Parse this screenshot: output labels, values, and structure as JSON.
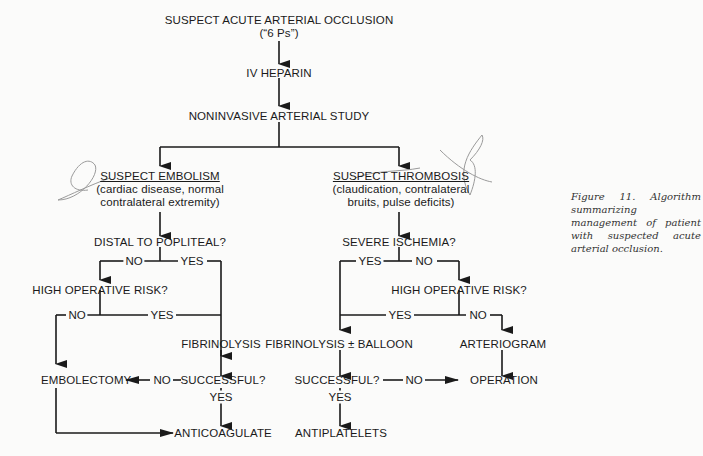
{
  "diagram": {
    "root": {
      "line1": "SUSPECT ACUTE ARTERIAL OCCLUSION",
      "line2": "(“6 Ps”)"
    },
    "step_heparin": "IV HEPARIN",
    "step_study": "NONINVASIVE ARTERIAL STUDY",
    "left_branch": {
      "heading": "SUSPECT EMBOLISM",
      "detail_line1": "(cardiac disease, normal",
      "detail_line2": "contralateral extremity)",
      "q_distal": "DISTAL TO POPLITEAL?",
      "q_distal_no": "NO",
      "q_distal_yes": "YES",
      "q_risk": "HIGH OPERATIVE RISK?",
      "q_risk_no": "NO",
      "q_risk_yes": "YES",
      "fibrinolysis": "FIBRINOLYSIS",
      "embolectomy": "EMBOLECTOMY",
      "q_success": "SUCCESSFUL?",
      "q_success_no": "NO",
      "q_success_yes": "YES",
      "anticoagulate": "ANTICOAGULATE"
    },
    "right_branch": {
      "heading": "SUSPECT THROMBOSIS",
      "detail_line1": "(claudication, contralateral",
      "detail_line2": "bruits, pulse deficits)",
      "q_ischemia": "SEVERE ISCHEMIA?",
      "q_ischemia_yes": "YES",
      "q_ischemia_no": "NO",
      "q_risk": "HIGH OPERATIVE RISK?",
      "q_risk_yes": "YES",
      "q_risk_no": "NO",
      "fibrinolysis_balloon": "FIBRINOLYSIS ± BALLOON",
      "arteriogram": "ARTERIOGRAM",
      "q_success": "SUCCESSFUL?",
      "q_success_no": "NO",
      "q_success_yes": "YES",
      "operation": "OPERATION",
      "antiplatelets": "ANTIPLATELETS"
    },
    "caption": "Figure 11. Algorithm summarizing management of patient with suspected acute arterial occlusion.",
    "colors": {
      "ink": "#1a1a1a",
      "paper": "#fbfbfa",
      "pencil": "#9a9a9a"
    }
  }
}
